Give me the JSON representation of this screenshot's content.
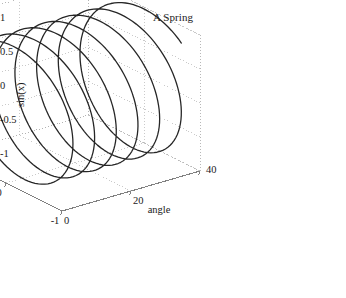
{
  "figure": {
    "title": "A Spring",
    "background_color": "#ffffff",
    "curve_color": "#262626",
    "axis_color": "#808080",
    "grid_color": "#b0b0b0",
    "text_color": "#1a1a1a",
    "width": 346,
    "height": 298
  },
  "chart_data": {
    "type": "line",
    "title": "A Spring",
    "projection": "3d",
    "xlabel": "angle",
    "ylabel": "cos(x)",
    "zlabel": "sin(x)",
    "xlim": [
      0,
      40
    ],
    "ylim": [
      -1,
      1
    ],
    "zlim": [
      -1,
      1
    ],
    "xticks": [
      0,
      20,
      40
    ],
    "xtick_labels": [
      "0",
      "20",
      "40"
    ],
    "yticks": [
      1,
      0,
      -1
    ],
    "ytick_labels": [
      "1",
      "0",
      "-1"
    ],
    "zticks": [
      1,
      0.5,
      0,
      -0.5,
      -1
    ],
    "ztick_labels": [
      "1",
      "0.5",
      "0",
      "-0.5",
      "-1"
    ],
    "grid": true,
    "legend": null,
    "series": [
      {
        "name": "spring",
        "parametric": true,
        "formula_x": "t",
        "formula_y": "cos(t)",
        "formula_z": "sin(t)",
        "t_start": 0,
        "t_end": 40,
        "t_samples": 600,
        "turns": 6.37,
        "color": "#262626",
        "line_width": 1.3
      }
    ]
  },
  "axes": {
    "x_title": "angle",
    "y_title": "cos(x)",
    "z_title": "sin(x)",
    "x_ticks": [
      "0",
      "20",
      "40"
    ],
    "y_ticks": [
      "1",
      "0",
      "-1"
    ],
    "z_ticks": [
      "1",
      "0.5",
      "0",
      "-0.5",
      "-1"
    ]
  }
}
